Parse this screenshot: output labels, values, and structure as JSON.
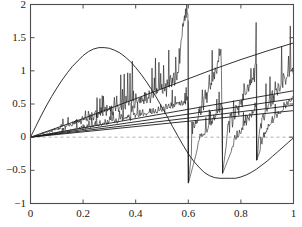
{
  "chart_data": {
    "type": "line",
    "title": "",
    "xlabel": "",
    "ylabel": "",
    "xlim": [
      0,
      1
    ],
    "ylim": [
      -1,
      2
    ],
    "grid": false,
    "legend": null,
    "xticks": [
      0,
      0.2,
      0.4,
      0.6,
      0.8,
      1
    ],
    "xtick_labels": [
      "0",
      "0.2",
      "0.4",
      "0.6",
      "0.8",
      "1"
    ],
    "yticks": [
      -1,
      -0.5,
      0,
      0.5,
      1,
      1.5,
      2
    ],
    "ytick_labels": [
      "−1",
      "−0.5",
      "0",
      "0.5",
      "1",
      "1.5",
      "2"
    ],
    "zero_line": {
      "y": 0,
      "style": "dashed",
      "color": "#9a9a9a"
    },
    "axes_color": "#4d4d4d",
    "line_color": "#1a1a1a",
    "series": [
      {
        "name": "arch",
        "kind": "smooth",
        "comment": "large sine-like arch rising from origin, peak ~1.35 at x~0.26, crossing zero near x~0.56, minimum ~-0.62 near x~0.78, returning toward 0 at x=1",
        "points": [
          [
            0.0,
            0.0
          ],
          [
            0.02,
            0.16
          ],
          [
            0.04,
            0.32
          ],
          [
            0.06,
            0.47
          ],
          [
            0.08,
            0.61
          ],
          [
            0.1,
            0.74
          ],
          [
            0.12,
            0.86
          ],
          [
            0.14,
            0.97
          ],
          [
            0.16,
            1.07
          ],
          [
            0.18,
            1.15
          ],
          [
            0.2,
            1.23
          ],
          [
            0.22,
            1.29
          ],
          [
            0.24,
            1.33
          ],
          [
            0.26,
            1.35
          ],
          [
            0.28,
            1.35
          ],
          [
            0.3,
            1.34
          ],
          [
            0.32,
            1.31
          ],
          [
            0.34,
            1.27
          ],
          [
            0.36,
            1.21
          ],
          [
            0.38,
            1.14
          ],
          [
            0.4,
            1.05
          ],
          [
            0.42,
            0.95
          ],
          [
            0.44,
            0.84
          ],
          [
            0.46,
            0.72
          ],
          [
            0.48,
            0.59
          ],
          [
            0.5,
            0.45
          ],
          [
            0.52,
            0.31
          ],
          [
            0.54,
            0.16
          ],
          [
            0.56,
            0.02
          ],
          [
            0.58,
            -0.12
          ],
          [
            0.6,
            -0.25
          ],
          [
            0.62,
            -0.36
          ],
          [
            0.64,
            -0.45
          ],
          [
            0.66,
            -0.53
          ],
          [
            0.68,
            -0.58
          ],
          [
            0.7,
            -0.61
          ],
          [
            0.72,
            -0.62
          ],
          [
            0.74,
            -0.62
          ],
          [
            0.76,
            -0.62
          ],
          [
            0.78,
            -0.62
          ],
          [
            0.8,
            -0.6
          ],
          [
            0.82,
            -0.57
          ],
          [
            0.84,
            -0.53
          ],
          [
            0.86,
            -0.48
          ],
          [
            0.88,
            -0.42
          ],
          [
            0.9,
            -0.36
          ],
          [
            0.92,
            -0.29
          ],
          [
            0.94,
            -0.22
          ],
          [
            0.96,
            -0.15
          ],
          [
            0.98,
            -0.08
          ],
          [
            1.0,
            -0.01
          ]
        ]
      },
      {
        "name": "rising-curve",
        "kind": "smooth",
        "comment": "gently curving line from origin up to ~1.4 at x=1, slightly concave",
        "points": [
          [
            0.0,
            0.0
          ],
          [
            0.1,
            0.14
          ],
          [
            0.2,
            0.28
          ],
          [
            0.3,
            0.43
          ],
          [
            0.4,
            0.58
          ],
          [
            0.5,
            0.73
          ],
          [
            0.6,
            0.88
          ],
          [
            0.7,
            1.03
          ],
          [
            0.8,
            1.17
          ],
          [
            0.9,
            1.3
          ],
          [
            1.0,
            1.42
          ]
        ]
      },
      {
        "name": "ramp-1",
        "kind": "smooth",
        "comment": "straight ray from origin ending near 0.70 at x=1",
        "points": [
          [
            0.0,
            0.0
          ],
          [
            0.5,
            0.35
          ],
          [
            1.0,
            0.7
          ]
        ]
      },
      {
        "name": "ramp-2",
        "kind": "smooth",
        "comment": "straight ray from origin ending near 0.58 at x=1",
        "points": [
          [
            0.0,
            0.0
          ],
          [
            0.5,
            0.29
          ],
          [
            1.0,
            0.58
          ]
        ]
      },
      {
        "name": "ramp-3",
        "kind": "smooth",
        "comment": "straight ray from origin ending near 0.48 at x=1",
        "points": [
          [
            0.0,
            0.0
          ],
          [
            0.5,
            0.24
          ],
          [
            1.0,
            0.48
          ]
        ]
      },
      {
        "name": "ramp-4",
        "kind": "smooth",
        "comment": "straight ray from origin ending near 0.40 at x=1",
        "points": [
          [
            0.0,
            0.0
          ],
          [
            0.5,
            0.2
          ],
          [
            1.0,
            0.4
          ]
        ]
      },
      {
        "name": "noisy-sawtooth-upper",
        "kind": "noisy",
        "comment": "oscillatory trace with tall spikes; grows from origin, spikes reach ~1.8 near x=0.59, drops vertically to ~-0.70 at x=0.60, recovers and rises, drops again at x=0.73 to ~-0.55, rises, drops at x=0.86, then rises to ~0.95 at x=1",
        "envelope_high": [
          [
            0.0,
            0.0
          ],
          [
            0.1,
            0.1
          ],
          [
            0.2,
            0.22
          ],
          [
            0.3,
            0.34
          ],
          [
            0.4,
            0.47
          ],
          [
            0.5,
            0.62
          ],
          [
            0.56,
            0.8
          ],
          [
            0.585,
            1.8
          ],
          [
            0.599,
            1.75
          ],
          [
            0.6,
            -0.7
          ],
          [
            0.62,
            0.05
          ],
          [
            0.66,
            0.45
          ],
          [
            0.7,
            0.85
          ],
          [
            0.725,
            1.2
          ],
          [
            0.73,
            -0.55
          ],
          [
            0.75,
            0.05
          ],
          [
            0.8,
            0.45
          ],
          [
            0.85,
            0.85
          ],
          [
            0.858,
            1.1
          ],
          [
            0.86,
            -0.35
          ],
          [
            0.88,
            0.2
          ],
          [
            0.92,
            0.5
          ],
          [
            0.96,
            0.75
          ],
          [
            1.0,
            0.95
          ]
        ],
        "spike_amplitude": 0.28,
        "oscillation_period": 0.012
      },
      {
        "name": "noisy-sawtooth-lower",
        "kind": "noisy",
        "comment": "second oscillatory trace with smaller amplitude riding below the first, same drop points",
        "envelope_high": [
          [
            0.0,
            0.0
          ],
          [
            0.15,
            0.09
          ],
          [
            0.3,
            0.2
          ],
          [
            0.45,
            0.33
          ],
          [
            0.55,
            0.44
          ],
          [
            0.599,
            0.52
          ],
          [
            0.6,
            -0.7
          ],
          [
            0.64,
            -0.1
          ],
          [
            0.7,
            0.25
          ],
          [
            0.729,
            0.45
          ],
          [
            0.73,
            -0.55
          ],
          [
            0.78,
            -0.05
          ],
          [
            0.84,
            0.3
          ],
          [
            0.858,
            0.42
          ],
          [
            0.86,
            -0.35
          ],
          [
            0.9,
            0.1
          ],
          [
            0.95,
            0.35
          ],
          [
            1.0,
            0.58
          ]
        ],
        "spike_amplitude": 0.12,
        "oscillation_period": 0.01
      }
    ]
  },
  "axes": {
    "frame": "box",
    "tick_direction": "in",
    "background": "#ffffff"
  }
}
